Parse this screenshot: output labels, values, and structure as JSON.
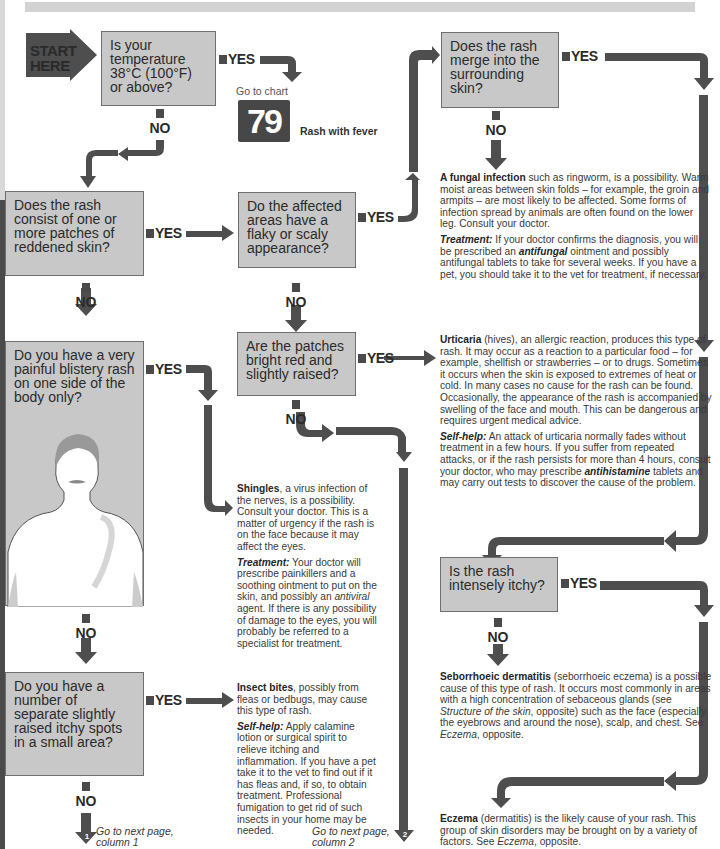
{
  "start_label": [
    "START",
    "HERE"
  ],
  "labels": {
    "yes": "YES",
    "no": "NO"
  },
  "q1": {
    "question": "Is your temperature 38°C (100°F) or above?"
  },
  "chart_ref": {
    "goto": "Go to chart",
    "number": "79",
    "title": "Rash with fever"
  },
  "q2": {
    "question": "Does the rash consist of one or more patches of reddened skin?"
  },
  "q3": {
    "question": "Do the affected areas have a flaky or scaly appearance?"
  },
  "q4": {
    "question": "Does the rash merge into the surrounding skin?"
  },
  "q5": {
    "question": "Are the patches bright red and slightly raised?"
  },
  "q6": {
    "question": "Do you have a very painful blistery rash on one side of the body only?"
  },
  "q7": {
    "question": "Do you have a number of separate slightly raised itchy spots in a small area?"
  },
  "q8": {
    "question": "Is the rash intensely itchy?"
  },
  "fungal": {
    "title": "A fungal infection",
    "body": " such as ringworm, is a possibility. Warm moist areas between skin folds – for example, the groin and armpits – are most likely to be affected. Some forms of infection spread by animals are often found on the lower leg. Consult your doctor.",
    "treat_label": "Treatment:",
    "treat_a": " If your doctor confirms the diagnosis, you will be prescribed an ",
    "treat_em": "antifungal",
    "treat_b": " ointment and possibly antifungal tablets to take for several weeks. If you have a pet, you should take it to the vet for treatment, if necessary."
  },
  "urticaria": {
    "title": "Urticaria",
    "body": " (hives), an allergic reaction, produces this type of rash. It may occur as a reaction to a particular food – for example, shellfish or strawberries – or to drugs. Sometimes it occurs when the skin is exposed to extremes of heat or cold. In many cases no cause for the rash can be found. Occasionally, the appearance of the rash is accompanied by swelling of the face and mouth. This can be dangerous and requires urgent medical advice.",
    "help_label": "Self-help:",
    "help_a": " An attack of urticaria normally fades without treatment in a few hours. If you suffer from repeated attacks, or if the rash persists for more than 4 hours, consult your doctor, who may prescribe ",
    "help_em": "antihistamine",
    "help_b": " tablets and may carry out tests to discover the cause of the problem."
  },
  "shingles": {
    "title": "Shingles",
    "body": ", a virus infection of the nerves, is a possibility. Consult your doctor. This is a matter of urgency if the rash is on the face because it may affect the eyes.",
    "treat_label": "Treatment:",
    "treat_a": " Your doctor will prescribe painkillers and a soothing ointment to put on the skin, and possibly an ",
    "treat_em": "antiviral",
    "treat_b": " agent. If there is any possibility of damage to the eyes, you will probably be referred to a specialist for treatment."
  },
  "insect": {
    "title": "Insect bites",
    "body": ", possibly from fleas or bedbugs, may cause this type of rash.",
    "help_label": "Self-help:",
    "help": " Apply calamine lotion or surgical spirit to relieve itching and inflammation. If you have a pet take it to the vet to find out if it has fleas and, if so, to obtain treatment. Professional fumigation to get rid of such insects in your home may be needed."
  },
  "seborrhoeic": {
    "title": "Seborrhoeic dermatitis",
    "body_a": " (seborrhoeic eczema) is a possible cause of this type of rash. It occurs most commonly in areas with a high concentration of sebaceous glands (see ",
    "em1": "Structure of the skin",
    "body_b": ", opposite) such as the face (especially the eyebrows and around the nose), scalp, and chest. See ",
    "em2": "Eczema",
    "body_c": ", opposite."
  },
  "eczema": {
    "title": "Eczema",
    "body_a": " (dermatitis) is the likely cause of your rash. This group of skin disorders may be brought on by a variety of factors. See ",
    "em": "Eczema",
    "body_b": ", opposite."
  },
  "next1": {
    "num": "1",
    "text": "Go to next page, column 1"
  },
  "next2": {
    "num": "2",
    "text": "Go to next page, column 2"
  }
}
